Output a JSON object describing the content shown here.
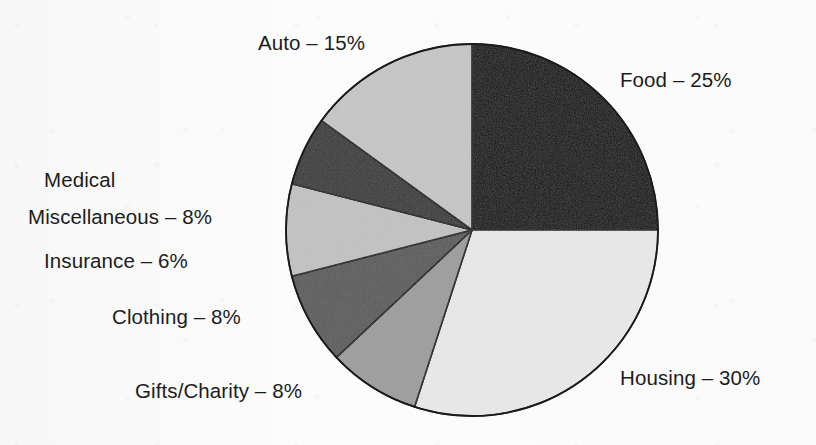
{
  "figure": {
    "background_color": "#fbfbfb",
    "ink_color": "#1c1c1c",
    "outline_color": "#1a1a1a"
  },
  "chart_data": {
    "type": "pie",
    "title": "",
    "subtitle": "",
    "xlabel": "",
    "ylabel": "",
    "grid": false,
    "legend_position": "none",
    "labels_placement": "outside-callout-text",
    "start_angle_deg": 0,
    "direction": "clockwise",
    "total_percent": 100,
    "units": "percent",
    "categories": [
      "Food",
      "Housing",
      "Gifts/Charity",
      "Clothing",
      "Miscellaneous",
      "Medical Insurance",
      "Auto"
    ],
    "values": [
      25,
      30,
      8,
      8,
      8,
      6,
      15
    ],
    "slices": [
      {
        "name": "Food",
        "value": 25,
        "value_text": "25%",
        "label": "Food – 25%",
        "label_lines": [
          "Food – 25%"
        ],
        "color": "#0d0d0d",
        "start_angle_deg": 0,
        "end_angle_deg": 90,
        "label_side": "right"
      },
      {
        "name": "Housing",
        "value": 30,
        "value_text": "30%",
        "label": "Housing – 30%",
        "label_lines": [
          "Housing – 30%"
        ],
        "color": "#e9e9e9",
        "start_angle_deg": 90,
        "end_angle_deg": 198,
        "label_side": "right"
      },
      {
        "name": "Gifts/Charity",
        "value": 8,
        "value_text": "8%",
        "label": "Gifts/Charity – 8%",
        "label_lines": [
          "Gifts/Charity – 8%"
        ],
        "color": "#9d9d9d",
        "start_angle_deg": 198,
        "end_angle_deg": 226.8,
        "label_side": "left"
      },
      {
        "name": "Clothing",
        "value": 8,
        "value_text": "8%",
        "label": "Clothing – 8%",
        "label_lines": [
          "Clothing – 8%"
        ],
        "color": "#5c5c5c",
        "start_angle_deg": 226.8,
        "end_angle_deg": 255.6,
        "label_side": "left"
      },
      {
        "name": "Miscellaneous",
        "value": 8,
        "value_text": "8%",
        "label": "Miscellaneous – 8%",
        "label_lines": [
          "Miscellaneous – 8%"
        ],
        "color": "#c2c2c2",
        "start_angle_deg": 255.6,
        "end_angle_deg": 284.4,
        "label_side": "left"
      },
      {
        "name": "Medical Insurance",
        "value": 6,
        "value_text": "6%",
        "label": "Medical Insurance – 6%",
        "label_lines": [
          "Medical",
          "Insurance – 6%"
        ],
        "color": "#3a3a3a",
        "start_angle_deg": 284.4,
        "end_angle_deg": 306,
        "label_side": "left"
      },
      {
        "name": "Auto",
        "value": 15,
        "value_text": "15%",
        "label": "Auto – 15%",
        "label_lines": [
          "Auto – 15%"
        ],
        "color": "#c6c6c6",
        "start_angle_deg": 306,
        "end_angle_deg": 360,
        "label_side": "top-left"
      }
    ]
  },
  "geometry": {
    "center_x": 472,
    "center_y": 230,
    "radius": 186
  }
}
